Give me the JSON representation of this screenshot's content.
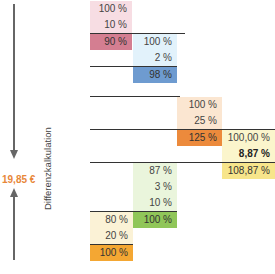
{
  "side": {
    "price": "19,85 €",
    "label": "Differenzkalkulation"
  },
  "colors": {
    "pink_light": "#f7dde3",
    "pink_dark": "#d47e91",
    "blue_light": "#e2f2fb",
    "blue_dark": "#6e9bd0",
    "peach_light": "#fbe6d1",
    "orange_dark": "#ec8a3c",
    "yellow_light": "#fbf5cc",
    "yellow_mid": "#f7e58b",
    "green_light": "#eaf5dc",
    "green_dark": "#90c659",
    "cream_light": "#fbf2d6",
    "orange_mid": "#f4a733",
    "price_orange": "#e8873a"
  },
  "blocks": {
    "pink": [
      "100 %",
      "10 %",
      "90 %"
    ],
    "blue": [
      "100 %",
      "2 %",
      "98 %"
    ],
    "peach": [
      "100 %",
      "25 %",
      "125 %"
    ],
    "yellow": [
      "100,00 %",
      "8,87 %",
      "108,87 %"
    ],
    "green": [
      "87 %",
      "3 %",
      "10 %",
      "100 %"
    ],
    "cream": [
      "80 %",
      "20 %",
      "100 %"
    ]
  }
}
